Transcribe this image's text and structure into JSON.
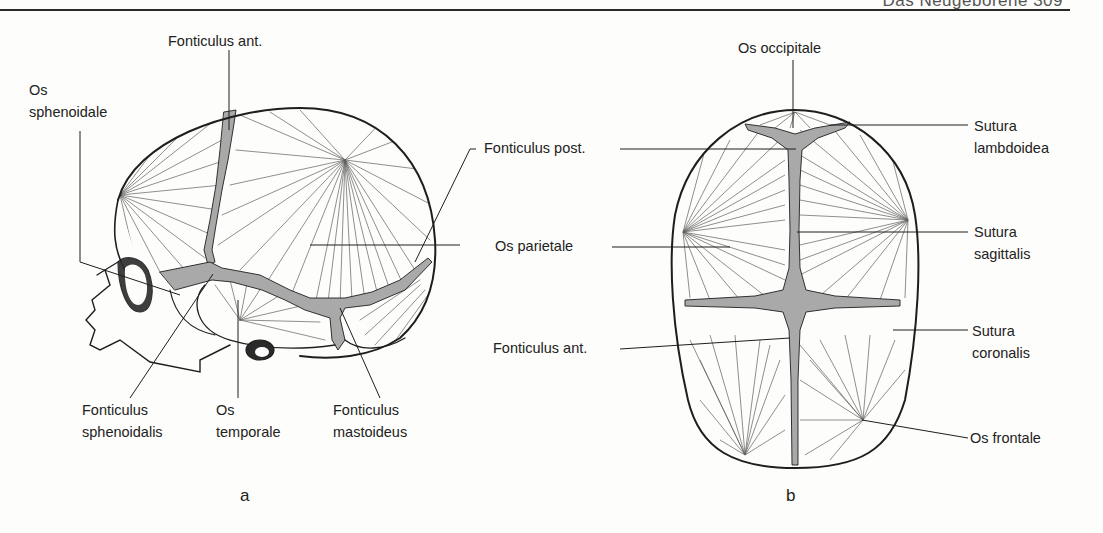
{
  "header": {
    "running_text": "Das Neugeborene  309"
  },
  "figure": {
    "panel_a": {
      "letter": "a",
      "view": "lateral",
      "labels": {
        "fonticulus_ant": "Fonticulus  ant.",
        "os_sphenoidale_1": "Os",
        "os_sphenoidale_2": "sphenoidale",
        "fonticulus_sphenoidalis_1": "Fonticulus",
        "fonticulus_sphenoidalis_2": "sphenoidalis",
        "os_temporale_1": "Os",
        "os_temporale_2": "temporale",
        "fonticulus_mastoideus_1": "Fonticulus",
        "fonticulus_mastoideus_2": "mastoideus"
      }
    },
    "shared_labels": {
      "fonticulus_post": "Fonticulus post.",
      "os_parietale": "Os parietale",
      "fonticulus_ant_b": "Fonticulus ant."
    },
    "panel_b": {
      "letter": "b",
      "view": "superior",
      "labels": {
        "os_occipitale": "Os occipitale",
        "sutura_lambdoidea_1": "Sutura",
        "sutura_lambdoidea_2": "lambdoidea",
        "sutura_sagittalis_1": "Sutura",
        "sutura_sagittalis_2": "sagittalis",
        "sutura_coronalis_1": "Sutura",
        "sutura_coronalis_2": "coronalis",
        "os_frontale": "Os frontale"
      }
    },
    "colors": {
      "line": "#1e1e1e",
      "fontanelle": "#a9a9a9",
      "paper": "#fdfdfb"
    }
  }
}
